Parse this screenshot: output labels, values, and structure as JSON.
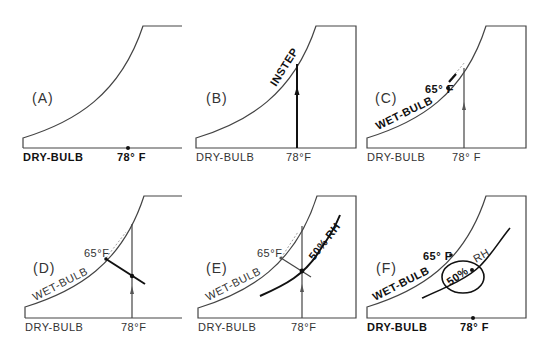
{
  "figure": {
    "panels": [
      {
        "id": "A",
        "letter": "(A)",
        "x_label": "DRY-BULB",
        "temp_label": "78° F"
      },
      {
        "id": "B",
        "letter": "(B)",
        "x_label": "DRY-BULB",
        "temp_label": "78°F",
        "curve_label": "INSTEP"
      },
      {
        "id": "C",
        "letter": "(C)",
        "x_label": "DRY-BULB",
        "temp_label": "78° F",
        "curve_label": "WET-BULB",
        "point_label": "65° F"
      },
      {
        "id": "D",
        "letter": "(D)",
        "x_label": "DRY-BULB",
        "temp_label": "78°F",
        "curve_label": "WET-BULB",
        "point_label": "65°F"
      },
      {
        "id": "E",
        "letter": "(E)",
        "x_label": "DRY-BULB",
        "temp_label": "78°F",
        "curve_label": "WET-BULB",
        "point_label": "65°F",
        "rh_label": "50% RH"
      },
      {
        "id": "F",
        "letter": "(F)",
        "x_label": "DRY-BULB",
        "temp_label": "78° F",
        "curve_label": "WET-BULB",
        "point_label": "65° F",
        "rh_percent": "50%",
        "rh_label": "RH"
      }
    ]
  }
}
